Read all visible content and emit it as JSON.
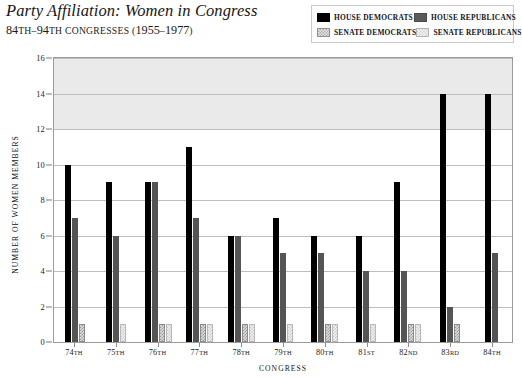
{
  "header": {
    "title": "Party Affiliation: Women in Congress",
    "subtitle_main": "84",
    "subtitle": "84TH–94TH CONGRESSES (1955–1977)"
  },
  "legend": {
    "position": "top-right",
    "entries": [
      {
        "label": "HOUSE DEMOCRATS",
        "key": "house_democrats",
        "swatch": "solid-black",
        "color": "#000000"
      },
      {
        "label": "HOUSE REPUBLICANS",
        "key": "house_republicans",
        "swatch": "solid-dark-gray",
        "color": "#555555"
      },
      {
        "label": "SENATE DEMOCRATS",
        "key": "senate_democrats",
        "swatch": "hatched-mid-gray",
        "color": "#9e9e9e"
      },
      {
        "label": "SENATE REPUBLICANS",
        "key": "senate_republicans",
        "swatch": "hatched-light-gray",
        "color": "#cccccc"
      }
    ]
  },
  "chart_data": {
    "type": "bar",
    "title": "Party Affiliation: Women in Congress",
    "subtitle": "84TH–94TH CONGRESSES (1955–1977)",
    "xlabel": "CONGRESS",
    "ylabel": "NUMBER OF WOMEN MEMBERS",
    "ylim": [
      0,
      16
    ],
    "yticks": [
      0,
      2,
      4,
      6,
      8,
      10,
      12,
      14,
      16
    ],
    "grid": true,
    "legend_position": "top-right",
    "categories": [
      "74TH",
      "75TH",
      "76TH",
      "77TH",
      "78TH",
      "79TH",
      "80TH",
      "81ST",
      "82ND",
      "83RD",
      "84TH"
    ],
    "category_labels": [
      {
        "num": "74",
        "ord": "TH"
      },
      {
        "num": "75",
        "ord": "TH"
      },
      {
        "num": "76",
        "ord": "TH"
      },
      {
        "num": "77",
        "ord": "TH"
      },
      {
        "num": "78",
        "ord": "TH"
      },
      {
        "num": "79",
        "ord": "TH"
      },
      {
        "num": "80",
        "ord": "TH"
      },
      {
        "num": "81",
        "ord": "ST"
      },
      {
        "num": "82",
        "ord": "ND"
      },
      {
        "num": "83",
        "ord": "RD"
      },
      {
        "num": "84",
        "ord": "TH"
      }
    ],
    "series": [
      {
        "name": "HOUSE DEMOCRATS",
        "color": "#000000",
        "values": [
          10,
          9,
          9,
          11,
          6,
          7,
          6,
          6,
          9,
          14,
          14
        ]
      },
      {
        "name": "HOUSE REPUBLICANS",
        "color": "#555555",
        "values": [
          7,
          6,
          9,
          7,
          6,
          5,
          5,
          4,
          4,
          2,
          5
        ]
      },
      {
        "name": "SENATE DEMOCRATS",
        "color": "#9e9e9e",
        "values": [
          1,
          0,
          1,
          1,
          1,
          0,
          1,
          0,
          1,
          1,
          0
        ]
      },
      {
        "name": "SENATE REPUBLICANS",
        "color": "#cccccc",
        "values": [
          0,
          1,
          1,
          1,
          1,
          1,
          1,
          1,
          1,
          0,
          0
        ]
      }
    ]
  },
  "axes": {
    "y_title": "NUMBER OF WOMEN MEMBERS",
    "x_title": "CONGRESS"
  }
}
